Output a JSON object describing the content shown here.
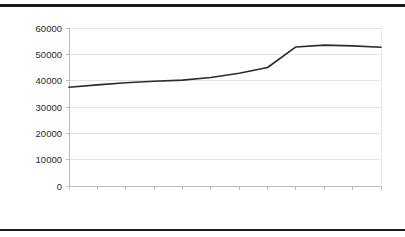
{
  "chart_data": {
    "type": "line",
    "title": "",
    "subtitle": "",
    "xlabel": "",
    "ylabel": "",
    "categories": [
      "1994",
      "1995",
      "1996",
      "1997",
      "1998",
      "1999",
      "2000",
      "2001",
      "2002",
      "2003",
      "2004",
      "2005"
    ],
    "values": [
      37500,
      38400,
      39200,
      39800,
      40200,
      41200,
      42800,
      45000,
      52800,
      53500,
      53200,
      52700
    ],
    "series": [
      {
        "name": "series-1",
        "values": [
          37500,
          38400,
          39200,
          39800,
          40200,
          41200,
          42800,
          45000,
          52800,
          53500,
          53200,
          52700
        ]
      }
    ],
    "ylim": [
      0,
      60000
    ],
    "yticks": [
      0,
      10000,
      20000,
      30000,
      40000,
      50000,
      60000
    ],
    "ytick_labels": [
      "0",
      "10000",
      "20000",
      "30000",
      "40000",
      "50000",
      "60000"
    ],
    "xtick_labels": [
      "1994",
      "1995",
      "1996",
      "1997",
      "1998",
      "1999",
      "2000",
      "2001",
      "2002",
      "2003",
      "2004",
      "2005"
    ],
    "grid": true,
    "grid_axis": "y",
    "legend": false,
    "legend_position": "none",
    "line_color": "#2b2b2b",
    "grid_color": "#e4e4e4",
    "axis_color": "#bdbdbd",
    "background_color": "#ffffff",
    "xlabel_rotation": -90
  },
  "decorations": {
    "top_rule_color": "#1a1a1a",
    "bottom_rule_color": "#1a1a1a"
  }
}
